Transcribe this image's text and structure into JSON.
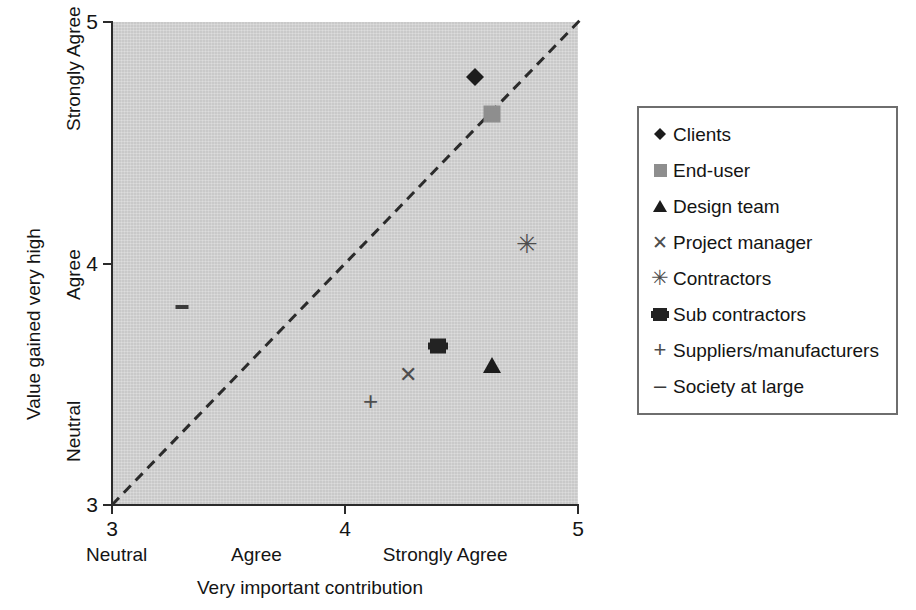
{
  "chart_data": {
    "type": "scatter",
    "title": "",
    "xlabel": "Very important contribution",
    "ylabel": "Value gained very high",
    "xlim": [
      3,
      5
    ],
    "ylim": [
      3,
      5
    ],
    "x_tick_values": [
      "3",
      "4",
      "5"
    ],
    "y_tick_values": [
      "3",
      "4",
      "5"
    ],
    "x_category_labels": [
      "Neutral",
      "Agree",
      "Strongly Agree"
    ],
    "y_category_labels": [
      "Neutral",
      "Agree",
      "Strongly Agree"
    ],
    "grid": false,
    "legend_position": "right",
    "background_color": "#c9c9c9",
    "reference_line": {
      "style": "dashed",
      "label": "",
      "from": [
        3,
        3
      ],
      "to": [
        5,
        5
      ]
    },
    "points": [
      {
        "name": "Clients",
        "marker": "diamond",
        "color": "#1c1c1c",
        "x": 4.56,
        "y": 4.81
      },
      {
        "name": "End-user",
        "marker": "square",
        "color": "#8e8e8e",
        "x": 4.63,
        "y": 4.62
      },
      {
        "name": "Design team",
        "marker": "triangle",
        "color": "#1c1c1c",
        "x": 4.63,
        "y": 3.58
      },
      {
        "name": "Project manager",
        "marker": "x",
        "color": "#4d4d4d",
        "x": 4.27,
        "y": 3.54
      },
      {
        "name": "Contractors",
        "marker": "asterisk",
        "color": "#4d4d4d",
        "x": 4.78,
        "y": 4.08
      },
      {
        "name": "Sub contractors",
        "marker": "filled-hexsq",
        "color": "#232323",
        "x": 4.4,
        "y": 3.66
      },
      {
        "name": "Suppliers/manufacturers",
        "marker": "plus",
        "color": "#4d4d4d",
        "x": 4.11,
        "y": 3.43
      },
      {
        "name": "Society at large",
        "marker": "dash",
        "color": "#3a3a3a",
        "x": 3.3,
        "y": 3.82
      }
    ]
  },
  "axes": {
    "y_title": "Value gained very high",
    "x_title": "Very important contribution",
    "y_ticks": [
      {
        "label": "5",
        "value": 5
      },
      {
        "label": "4",
        "value": 4
      },
      {
        "label": "3",
        "value": 3
      }
    ],
    "x_ticks": [
      {
        "label": "3",
        "value": 3
      },
      {
        "label": "4",
        "value": 4
      },
      {
        "label": "5",
        "value": 5
      }
    ],
    "y_categories": [
      {
        "label": "Strongly Agree",
        "value": 4.55
      },
      {
        "label": "Agree",
        "value": 3.85
      },
      {
        "label": "Neutral",
        "value": 3.18
      }
    ],
    "x_categories": [
      {
        "label": "Neutral",
        "value": 3.02
      },
      {
        "label": "Agree",
        "value": 3.62
      },
      {
        "label": "Strongly Agree",
        "value": 4.42
      }
    ]
  },
  "legend": {
    "items": [
      {
        "label": "Clients",
        "marker": "diamond",
        "color": "#1c1c1c"
      },
      {
        "label": "End-user",
        "marker": "square",
        "color": "#8e8e8e"
      },
      {
        "label": "Design team",
        "marker": "triangle",
        "color": "#1c1c1c"
      },
      {
        "label": "Project manager",
        "marker": "x",
        "color": "#4d4d4d"
      },
      {
        "label": "Contractors",
        "marker": "asterisk",
        "color": "#4d4d4d"
      },
      {
        "label": "Sub contractors",
        "marker": "filled-hexsq",
        "color": "#232323"
      },
      {
        "label": "Suppliers/manufacturers",
        "marker": "plus",
        "color": "#4d4d4d"
      },
      {
        "label": "Society at large",
        "marker": "dash",
        "color": "#3a3a3a"
      }
    ]
  }
}
